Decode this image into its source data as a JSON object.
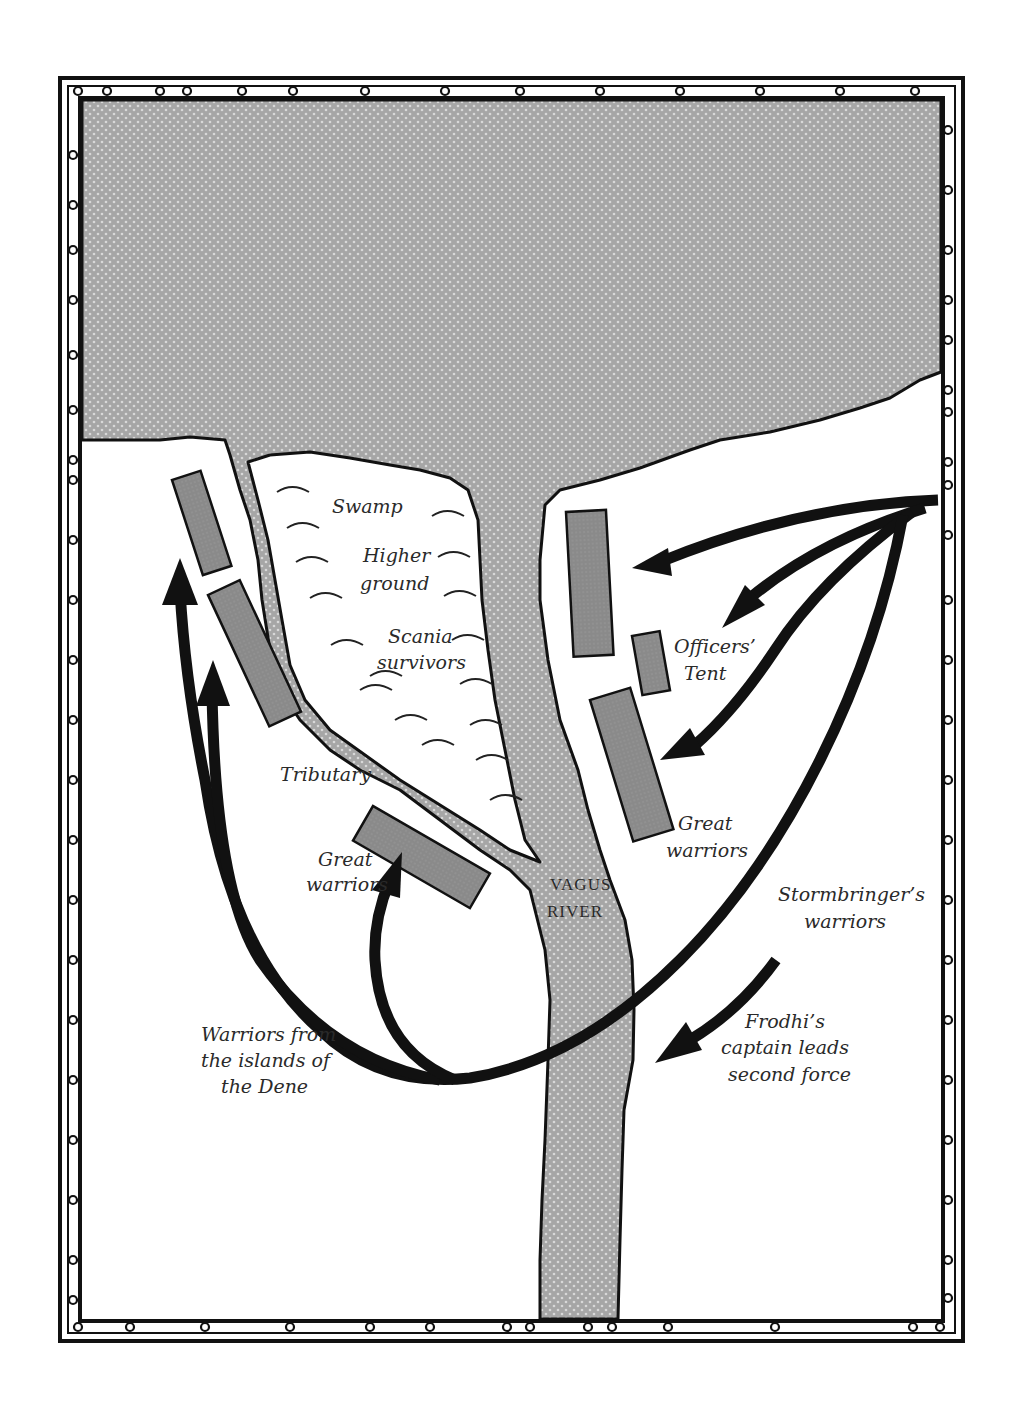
{
  "map": {
    "title": "Battle map at the Vagus River",
    "colors": {
      "water": "#a9a9a9",
      "camp": "#8c8c8c",
      "ink": "#111111",
      "land": "#ffffff"
    },
    "labels": {
      "swamp": "Swamp",
      "higher_ground_1": "Higher",
      "higher_ground_2": "ground",
      "scania_1": "Scania",
      "scania_2": "survivors",
      "officers_1": "Officers’",
      "officers_2": "Tent",
      "great_right_1": "Great",
      "great_right_2": "warriors",
      "tributary": "Tributary",
      "great_left_1": "Great",
      "great_left_2": "warriors",
      "river_1": "Vagus",
      "river_2": "River",
      "stormbringer_1": "Stormbringer’s",
      "stormbringer_2": "warriors",
      "frodhi_1": "Frodhi’s",
      "frodhi_2": "captain leads",
      "frodhi_3": "second force",
      "dene_1": "Warriors from",
      "dene_2": "the islands of",
      "dene_3": "the Dene"
    },
    "legend_icons": [
      "swamp-symbol-icon",
      "camp-block-icon",
      "army-arrow-icon"
    ]
  }
}
